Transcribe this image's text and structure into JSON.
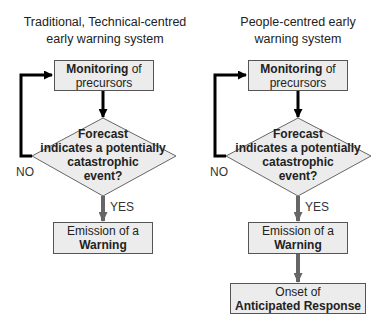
{
  "left": {
    "title_line1": "Traditional, Technical-centred",
    "title_line2": "early warning system",
    "monitor": {
      "bold": "Monitoring",
      "rest": " of",
      "line2": "precursors"
    },
    "decision": {
      "line1": "Forecast",
      "line2": "indicates a potentially",
      "line3": "catastrophic",
      "line4": "event?"
    },
    "no_label": "NO",
    "yes_label": "YES",
    "emission": {
      "line1": "Emission of a",
      "line2": "Warning"
    }
  },
  "right": {
    "title_line1": "People-centred early",
    "title_line2": "warning system",
    "monitor": {
      "bold": "Monitoring",
      "rest": " of",
      "line2": "precursors"
    },
    "decision": {
      "line1": "Forecast",
      "line2": "indicates a potentially",
      "line3": "catastrophic",
      "line4": "event?"
    },
    "no_label": "NO",
    "yes_label": "YES",
    "emission": {
      "line1": "Emission of a",
      "line2": "Warning"
    },
    "onset": {
      "line1": "Onset of",
      "line2": "Anticipated Response"
    }
  },
  "colors": {
    "box_fill": "#ececec",
    "box_border": "#555555",
    "loop_arrow": "#000000",
    "flow_arrow": "#666666"
  }
}
